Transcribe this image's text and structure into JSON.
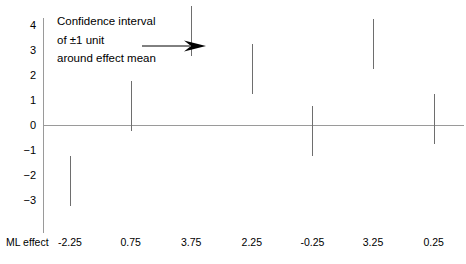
{
  "chart_data": {
    "type": "bar",
    "title": "",
    "subtitle": "",
    "xlabel": "ML effect",
    "ylabel": "",
    "grid": false,
    "legend": "none",
    "categories": [
      "-2.25",
      "0.75",
      "3.75",
      "2.25",
      "-0.25",
      "3.25",
      "0.25"
    ],
    "values": [
      -2.25,
      0.75,
      3.75,
      2.25,
      -0.25,
      3.25,
      0.25
    ],
    "series": [
      {
        "name": "Confidence interval of ±1 unit around effect mean",
        "values": [
          -2.25,
          0.75,
          3.75,
          2.25,
          -0.25,
          3.25,
          0.25
        ],
        "ci_low": [
          -3.25,
          -0.25,
          2.75,
          1.25,
          -1.25,
          2.25,
          -0.75
        ],
        "ci_high": [
          -1.25,
          1.75,
          4.75,
          3.25,
          0.75,
          4.25,
          1.25
        ],
        "ci_halfwidth": 1
      }
    ],
    "ylim": [
      -3.5,
      4.5
    ],
    "y_ticks": [
      "4",
      "3",
      "2",
      "1",
      "0",
      "−1",
      "−2",
      "−3"
    ],
    "y_tick_values": [
      4,
      3,
      2,
      1,
      0,
      -1,
      -2,
      -3
    ],
    "x_tick_labels": [
      "-2.25",
      "0.75",
      "3.75",
      "2.25",
      "-0.25",
      "3.25",
      "0.25"
    ],
    "zero_reference_line": 0,
    "annotations": [
      {
        "name": "confidence-interval-callout",
        "line1": "Confidence interval",
        "line2": "of ±1 unit",
        "line3": "around effect mean",
        "arrow": "right-arrow",
        "points_to_category": "3.75"
      }
    ],
    "colors": {
      "axis": "#9a9a9a",
      "bar": "#6e6e6e",
      "text": "#000000",
      "background": "#ffffff"
    }
  },
  "axis": {
    "caption": "ML effect"
  },
  "annotation": {
    "line1": "Confidence interval",
    "line2": "of ±1 unit",
    "line3": "around effect mean"
  },
  "y_ticks": [
    {
      "label": "4"
    },
    {
      "label": "3"
    },
    {
      "label": "2"
    },
    {
      "label": "1"
    },
    {
      "label": "0"
    },
    {
      "label": "−1"
    },
    {
      "label": "−2"
    },
    {
      "label": "−3"
    }
  ],
  "x_ticks": [
    {
      "label": "-2.25"
    },
    {
      "label": "0.75"
    },
    {
      "label": "3.75"
    },
    {
      "label": "2.25"
    },
    {
      "label": "-0.25"
    },
    {
      "label": "3.25"
    },
    {
      "label": "0.25"
    }
  ]
}
